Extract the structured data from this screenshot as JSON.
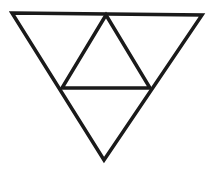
{
  "diagram": {
    "stroke_color": "#1a1a1a",
    "background_color": "#ffffff",
    "stroke_width": 3.5,
    "vertices": {
      "outer_top_left": [
        12,
        13
      ],
      "outer_top_right": [
        202,
        15
      ],
      "outer_bottom": [
        104,
        160
      ],
      "mid_top": [
        106,
        15
      ],
      "mid_left": [
        62,
        88
      ],
      "mid_right": [
        150,
        88
      ]
    },
    "labels": []
  }
}
